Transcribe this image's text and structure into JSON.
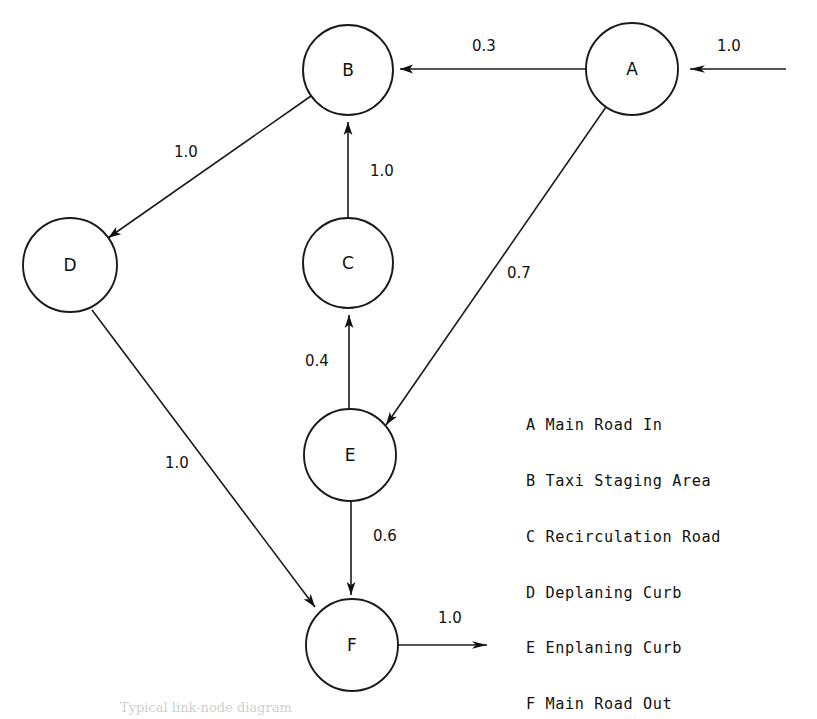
{
  "diagram": {
    "title": "Typical link-node diagram",
    "caption": "Typical link-node diagram",
    "stroke_color": "#1a1a1a",
    "background_color": "#ffffff",
    "node_radius": 46,
    "nodes": [
      {
        "id": "A",
        "label": "A",
        "cx": 632,
        "cy": 69,
        "r": 46
      },
      {
        "id": "B",
        "label": "B",
        "cx": 348,
        "cy": 70,
        "r": 45
      },
      {
        "id": "C",
        "label": "C",
        "cx": 348,
        "cy": 263,
        "r": 45
      },
      {
        "id": "D",
        "label": "D",
        "cx": 70,
        "cy": 265,
        "r": 47
      },
      {
        "id": "E",
        "label": "E",
        "cx": 350,
        "cy": 455,
        "r": 46
      },
      {
        "id": "F",
        "label": "F",
        "cx": 352,
        "cy": 645,
        "r": 46
      }
    ],
    "edges": [
      {
        "id": "in-A",
        "from": "external",
        "to": "A",
        "weight": "1.0",
        "label_x": 729,
        "label_y": 51
      },
      {
        "id": "A-B",
        "from": "A",
        "to": "B",
        "weight": "0.3",
        "label_x": 484,
        "label_y": 51
      },
      {
        "id": "B-D",
        "from": "B",
        "to": "D",
        "weight": "1.0",
        "label_x": 186,
        "label_y": 157
      },
      {
        "id": "C-B",
        "from": "C",
        "to": "B",
        "weight": "1.0",
        "label_x": 382,
        "label_y": 176
      },
      {
        "id": "A-E",
        "from": "A",
        "to": "E",
        "weight": "0.7",
        "label_x": 519,
        "label_y": 278
      },
      {
        "id": "E-C",
        "from": "E",
        "to": "C",
        "weight": "0.4",
        "label_x": 317,
        "label_y": 366
      },
      {
        "id": "E-F",
        "from": "E",
        "to": "F",
        "weight": "0.6",
        "label_x": 385,
        "label_y": 541
      },
      {
        "id": "D-F",
        "from": "D",
        "to": "F",
        "weight": "1.0",
        "label_x": 177,
        "label_y": 468
      },
      {
        "id": "out-F",
        "from": "F",
        "to": "external",
        "weight": "1.0",
        "label_x": 450,
        "label_y": 623
      }
    ]
  },
  "legend": {
    "items": [
      {
        "key": "A",
        "text": "A Main Road In"
      },
      {
        "key": "B",
        "text": "B Taxi Staging Area"
      },
      {
        "key": "C",
        "text": "C Recirculation Road"
      },
      {
        "key": "D",
        "text": "D Deplaning Curb"
      },
      {
        "key": "E",
        "text": "E Enplaning Curb"
      },
      {
        "key": "F",
        "text": "F Main Road Out"
      }
    ]
  }
}
